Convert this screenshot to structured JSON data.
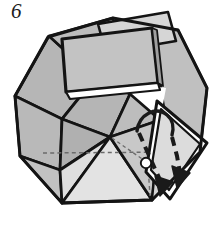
{
  "figure": {
    "step_number": "6",
    "caption": "",
    "kind": "origami-folding-diagram",
    "colors": {
      "background": "#ffffff",
      "stroke": "#141414",
      "fill_dark": "#b3b3b3",
      "fill_mid": "#c4c4c4",
      "fill_light": "#dcdcdc",
      "fill_lighter": "#e9e9e9",
      "fill_white": "#ffffff",
      "dashed_fold": "#6e6e6e",
      "arrow": "#1a1a1a",
      "dot_fill": "#ffffff",
      "dot_stroke": "#141414"
    },
    "markers": {
      "target_dot": {
        "label": "tuck-target-point",
        "cx": 146,
        "cy": 163,
        "r": 5
      }
    },
    "arrow": {
      "label": "fold-arrow",
      "style": "dashed-shaft-with-solid-head",
      "direction": "down-right",
      "curved": true
    }
  }
}
